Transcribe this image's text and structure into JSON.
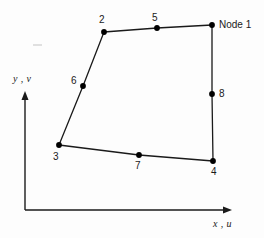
{
  "figure": {
    "type": "diagram",
    "background_color": "#fdfdfd",
    "line_color": "#1a1a1a",
    "node_color": "#000000"
  },
  "axes": {
    "origin": {
      "x": 25,
      "y": 210
    },
    "x_axis": {
      "label": "x , u",
      "label_x": 213,
      "label_y": 219,
      "end_x": 232,
      "end_y": 210
    },
    "y_axis": {
      "label": "y , v",
      "label_x": 13,
      "label_y": 74,
      "end_x": 25,
      "end_y": 93
    }
  },
  "element": {
    "nodes": [
      {
        "id": "1",
        "label": "Node 1",
        "x": 212,
        "y": 25,
        "label_x": 219,
        "label_y": 20,
        "kind": "corner"
      },
      {
        "id": "2",
        "label": "2",
        "x": 104,
        "y": 32,
        "label_x": 99,
        "label_y": 15,
        "kind": "corner"
      },
      {
        "id": "3",
        "label": "3",
        "x": 59,
        "y": 145,
        "label_x": 53,
        "label_y": 152,
        "kind": "corner"
      },
      {
        "id": "4",
        "label": "4",
        "x": 213,
        "y": 161,
        "label_x": 211,
        "label_y": 167,
        "kind": "corner"
      },
      {
        "id": "5",
        "label": "5",
        "x": 157,
        "y": 28,
        "label_x": 152,
        "label_y": 13,
        "kind": "midside"
      },
      {
        "id": "6",
        "label": "6",
        "x": 83,
        "y": 86,
        "label_x": 71,
        "label_y": 76,
        "kind": "midside"
      },
      {
        "id": "7",
        "label": "7",
        "x": 139,
        "y": 155,
        "label_x": 135,
        "label_y": 161,
        "kind": "midside"
      },
      {
        "id": "8",
        "label": "8",
        "x": 212,
        "y": 94,
        "label_x": 219,
        "label_y": 89,
        "kind": "midside"
      }
    ],
    "edges": [
      {
        "name": "top-edge",
        "from": "2",
        "via": "5",
        "to": "1"
      },
      {
        "name": "right-edge",
        "from": "1",
        "via": "8",
        "to": "4"
      },
      {
        "name": "bottom-edge",
        "from": "3",
        "via": "7",
        "to": "4"
      },
      {
        "name": "left-edge",
        "from": "2",
        "via": "6",
        "to": "3"
      }
    ]
  }
}
